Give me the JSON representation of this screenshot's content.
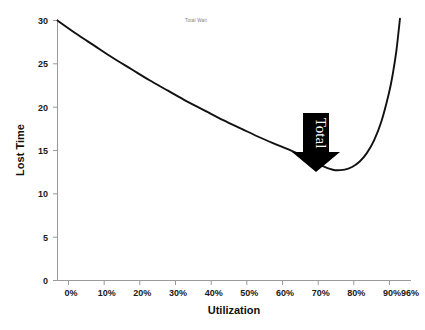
{
  "chart_data": {
    "type": "line",
    "title": "Total Wait",
    "xlabel": "Utilization",
    "ylabel": "Lost Time",
    "xlim": [
      0,
      96
    ],
    "ylim": [
      0,
      30
    ],
    "grid": false,
    "legend_position": "top-center",
    "x_tick_labels": [
      "0%",
      "10%",
      "20%",
      "30%",
      "40%",
      "50%",
      "60%",
      "70%",
      "80%",
      "90%",
      "96%"
    ],
    "x_tick_values": [
      0,
      10,
      20,
      30,
      40,
      50,
      60,
      70,
      80,
      90,
      96
    ],
    "y_tick_labels": [
      "0",
      "5",
      "10",
      "15",
      "20",
      "25",
      "30"
    ],
    "y_tick_values": [
      0,
      5,
      10,
      15,
      20,
      25,
      30
    ],
    "series": [
      {
        "name": "Total Wait",
        "color": "#111111",
        "x": [
          0,
          5,
          10,
          15,
          20,
          25,
          30,
          35,
          40,
          45,
          50,
          55,
          60,
          65,
          70,
          72,
          75,
          78,
          80,
          82,
          84,
          86,
          88,
          90,
          91,
          92,
          93
        ],
        "values": [
          30.0,
          28.5,
          27.1,
          25.7,
          24.4,
          23.1,
          21.9,
          20.7,
          19.6,
          18.5,
          17.5,
          16.5,
          15.6,
          14.7,
          13.6,
          13.2,
          12.75,
          12.8,
          13.1,
          13.7,
          14.7,
          16.2,
          18.4,
          21.6,
          23.7,
          26.4,
          30.2
        ]
      }
    ],
    "annotations": [
      {
        "name": "total-arrow",
        "label": "Total",
        "shape": "down-arrow",
        "fill": "#000000",
        "text_color": "#ffffff",
        "text_rotation": 90,
        "points_at_x": "75%",
        "points_at_y": 13.0
      }
    ]
  }
}
